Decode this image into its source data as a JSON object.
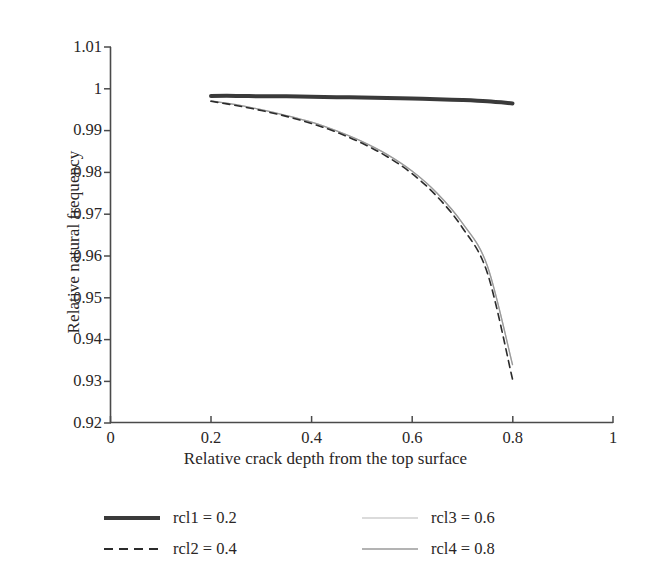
{
  "chart_data": {
    "type": "line",
    "title": "",
    "xlabel": "Relative crack depth from the top surface",
    "ylabel": "Relative natural frequency",
    "xlim": [
      0,
      1
    ],
    "ylim": [
      0.92,
      1.01
    ],
    "xticks": [
      "0",
      "0.2",
      "0.4",
      "0.6",
      "0.8",
      "1"
    ],
    "xtick_values": [
      0,
      0.2,
      0.4,
      0.6,
      0.8,
      1
    ],
    "yticks": [
      "0.92",
      "0.93",
      "0.94",
      "0.95",
      "0.96",
      "0.97",
      "0.98",
      "0.99",
      "1",
      "1.01"
    ],
    "ytick_values": [
      0.92,
      0.93,
      0.94,
      0.95,
      0.96,
      0.97,
      0.98,
      0.99,
      1.0,
      1.01
    ],
    "grid": false,
    "legend_position": "below-axes",
    "x": [
      0.2,
      0.25,
      0.3,
      0.35,
      0.4,
      0.45,
      0.5,
      0.55,
      0.6,
      0.65,
      0.7,
      0.75,
      0.8
    ],
    "series": [
      {
        "name": "rcl1 = 0.2",
        "label": "rcl1 = 0.2",
        "style": "solid-thick",
        "color": "#3a3a3a",
        "width": 4.0,
        "values": [
          0.9983,
          0.9983,
          0.9982,
          0.9982,
          0.9981,
          0.998,
          0.9979,
          0.9978,
          0.9977,
          0.9975,
          0.9973,
          0.997,
          0.9965
        ]
      },
      {
        "name": "rcl2 = 0.4",
        "label": "rcl2 = 0.4",
        "style": "dashed",
        "color": "#2b2b2b",
        "width": 1.6,
        "values": [
          0.997,
          0.996,
          0.9948,
          0.9934,
          0.9917,
          0.9896,
          0.987,
          0.9838,
          0.9797,
          0.9742,
          0.9668,
          0.9559,
          0.9305
        ]
      },
      {
        "name": "rcl3 = 0.6",
        "label": "rcl3 = 0.6",
        "style": "solid-thin-light",
        "color": "#cfcfcf",
        "width": 1.3,
        "values": [
          0.9971,
          0.9962,
          0.995,
          0.9936,
          0.992,
          0.9899,
          0.9874,
          0.9843,
          0.9803,
          0.975,
          0.9679,
          0.9576,
          0.934
        ]
      },
      {
        "name": "rcl4 = 0.8",
        "label": "rcl4 = 0.8",
        "style": "solid-thin",
        "color": "#9a9a9a",
        "width": 1.3,
        "values": [
          0.9971,
          0.9962,
          0.995,
          0.9936,
          0.992,
          0.9899,
          0.9874,
          0.9843,
          0.9803,
          0.975,
          0.9679,
          0.9576,
          0.934
        ]
      }
    ]
  },
  "axes": {
    "ylabel": "Relative natural frequency",
    "xlabel": "Relative crack depth from the top surface",
    "yticks": [
      {
        "label": "1.01"
      },
      {
        "label": "1"
      },
      {
        "label": "0.99"
      },
      {
        "label": "0.98"
      },
      {
        "label": "0.97"
      },
      {
        "label": "0.96"
      },
      {
        "label": "0.95"
      },
      {
        "label": "0.94"
      },
      {
        "label": "0.93"
      },
      {
        "label": "0.92"
      }
    ],
    "xticks": [
      {
        "label": "0"
      },
      {
        "label": "0.2"
      },
      {
        "label": "0.4"
      },
      {
        "label": "0.6"
      },
      {
        "label": "0.8"
      },
      {
        "label": "1"
      }
    ]
  },
  "legend": {
    "items": [
      {
        "label": "rcl1 = 0.2",
        "style": "solid-thick",
        "color": "#3a3a3a"
      },
      {
        "label": "rcl2 = 0.4",
        "style": "dashed",
        "color": "#2b2b2b"
      },
      {
        "label": "rcl3 = 0.6",
        "style": "solid-thin-light",
        "color": "#cfcfcf"
      },
      {
        "label": "rcl4 = 0.8",
        "style": "solid-thin",
        "color": "#9a9a9a"
      }
    ]
  },
  "colors": {
    "axis": "#4a4a4a",
    "text": "#2a2626",
    "background": "#ffffff"
  }
}
